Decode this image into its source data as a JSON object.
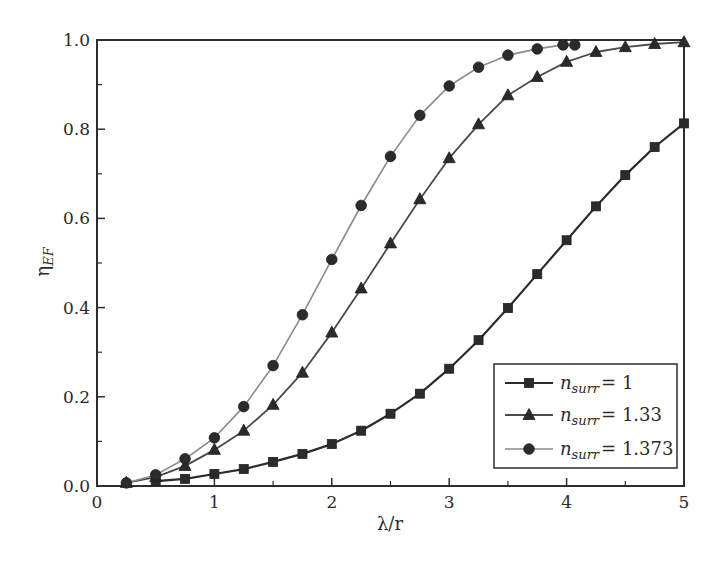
{
  "chart_data": {
    "type": "line",
    "title": "",
    "xlabel": "λ/r",
    "ylabel": "η_EF",
    "ylabel_main": "η",
    "ylabel_sub": "EF",
    "xlim": [
      0,
      5
    ],
    "ylim": [
      0.0,
      1.0
    ],
    "xticks": [
      0,
      1,
      2,
      3,
      4,
      5
    ],
    "xtick_labels": [
      "0",
      "1",
      "2",
      "3",
      "4",
      "5"
    ],
    "xminor": [
      0.5,
      1.5,
      2.5,
      3.5,
      4.5
    ],
    "yticks": [
      0.0,
      0.2,
      0.4,
      0.6,
      0.8,
      1.0
    ],
    "ytick_labels": [
      "0.0",
      "0.2",
      "0.4",
      "0.6",
      "0.8",
      "1.0"
    ],
    "yminor": [
      0.1,
      0.3,
      0.5,
      0.7,
      0.9
    ],
    "grid": false,
    "legend_position": "lower right",
    "series": [
      {
        "name": "n_surr = 1",
        "label_var": "n",
        "label_sub": "surr",
        "label_value": "= 1",
        "marker": "square",
        "color": "#2b2b2b",
        "line_width": 2.2,
        "x": [
          0.5,
          0.75,
          1.0,
          1.25,
          1.5,
          1.75,
          2.0,
          2.25,
          2.5,
          2.75,
          3.0,
          3.25,
          3.5,
          3.75,
          4.0,
          4.25,
          4.5,
          4.75,
          5.0
        ],
        "y": [
          0.011,
          0.016,
          0.027,
          0.038,
          0.054,
          0.072,
          0.094,
          0.124,
          0.162,
          0.207,
          0.263,
          0.327,
          0.399,
          0.475,
          0.551,
          0.627,
          0.697,
          0.76,
          0.813
        ]
      },
      {
        "name": "n_surr = 1.33",
        "label_var": "n",
        "label_sub": "surr",
        "label_value": "= 1.33",
        "marker": "triangle",
        "color": "#4a4a4a",
        "line_width": 1.8,
        "x": [
          0.25,
          0.5,
          0.75,
          1.0,
          1.25,
          1.5,
          1.75,
          2.0,
          2.25,
          2.5,
          2.75,
          3.0,
          3.25,
          3.5,
          3.75,
          4.0,
          4.25,
          4.5,
          4.75,
          5.0
        ],
        "y": [
          0.007,
          0.02,
          0.045,
          0.081,
          0.124,
          0.182,
          0.254,
          0.344,
          0.443,
          0.544,
          0.643,
          0.735,
          0.811,
          0.876,
          0.917,
          0.951,
          0.973,
          0.984,
          0.991,
          0.995
        ]
      },
      {
        "name": "n_surr = 1.373",
        "label_var": "n",
        "label_sub": "surr",
        "label_value": "= 1.373",
        "marker": "circle",
        "color": "#8a8a8a",
        "line_width": 1.6,
        "x": [
          0.25,
          0.5,
          0.75,
          1.0,
          1.25,
          1.5,
          1.75,
          2.0,
          2.25,
          2.5,
          2.75,
          3.0,
          3.25,
          3.5,
          3.75,
          3.97,
          4.07
        ],
        "y": [
          0.007,
          0.025,
          0.061,
          0.108,
          0.178,
          0.27,
          0.384,
          0.508,
          0.629,
          0.739,
          0.831,
          0.897,
          0.939,
          0.966,
          0.98,
          0.989,
          0.989
        ]
      }
    ]
  },
  "colors": {
    "frame": "#2e2e2e",
    "marker_fill": "#2b2b2b",
    "text": "#2a2a2a"
  }
}
